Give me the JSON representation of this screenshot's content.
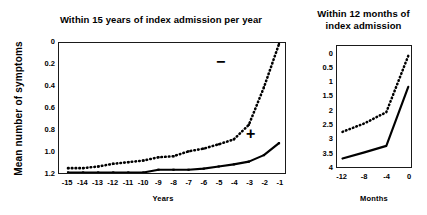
{
  "figure": {
    "ylabel": "Mean number of symptoms"
  },
  "panels": {
    "left": {
      "title": "Within 15 years of index admission per year",
      "xlabel": "Years",
      "yticks": [
        "1.2",
        "1.0",
        "0.8",
        "0.6",
        "0.4",
        "0.2",
        "0"
      ],
      "xticks": [
        "-15",
        "-14",
        "-13",
        "-12",
        "-11",
        "-10",
        "-9",
        "-8",
        "-7",
        "-6",
        "-5",
        "-4",
        "-3",
        "-2",
        "-1"
      ],
      "marker_negative": "−",
      "marker_positive": "+"
    },
    "right": {
      "title_line1": "Within 12 months of",
      "title_line2": "index admission",
      "xlabel": "Months",
      "yticks": [
        "4",
        "3.5",
        "3",
        "2.5",
        "2",
        "1.5",
        "1",
        "0.5",
        "0"
      ],
      "xticks": [
        "-12",
        "-8",
        "-4",
        "0"
      ]
    }
  },
  "chart_data": [
    {
      "type": "line",
      "id": "left-panel",
      "title": "Within 15 years of index admission per year",
      "xlabel": "Years",
      "ylabel": "Mean number of symptoms",
      "x": [
        -15,
        -14,
        -13,
        -12,
        -11,
        -10,
        -9,
        -8,
        -7,
        -6,
        -5,
        -4,
        -3,
        -2,
        -1
      ],
      "xlim": [
        -15.6,
        -0.6
      ],
      "ylim": [
        0,
        1.2
      ],
      "yticks": [
        0,
        0.2,
        0.4,
        0.6,
        0.8,
        1.0,
        1.2
      ],
      "grid": false,
      "legend": "inline annotation symbols on curves",
      "series": [
        {
          "name": "−",
          "label": "minus (negative)",
          "style": "dotted",
          "color": "#000000",
          "values": [
            0.045,
            0.045,
            0.06,
            0.085,
            0.1,
            0.115,
            0.145,
            0.155,
            0.2,
            0.225,
            0.265,
            0.31,
            0.445,
            0.79,
            1.19
          ]
        },
        {
          "name": "+",
          "label": "plus (positive)",
          "style": "solid",
          "color": "#000000",
          "values": [
            0.005,
            0.005,
            0.005,
            0.005,
            0.005,
            0.005,
            0.03,
            0.03,
            0.03,
            0.04,
            0.06,
            0.08,
            0.105,
            0.165,
            0.275
          ]
        }
      ]
    },
    {
      "type": "line",
      "id": "right-panel",
      "title": "Within 12 months of index admission",
      "xlabel": "Months",
      "ylabel": "Mean number of symptoms",
      "x": [
        -12,
        -8,
        -4,
        0
      ],
      "xlim": [
        -13,
        0.5
      ],
      "ylim": [
        0,
        4.3
      ],
      "yticks": [
        0,
        0.5,
        1,
        1.5,
        2,
        2.5,
        3,
        3.5,
        4
      ],
      "grid": false,
      "series": [
        {
          "name": "−",
          "label": "minus (negative)",
          "style": "dotted",
          "color": "#000000",
          "values": [
            1.25,
            1.55,
            1.95,
            3.95
          ]
        },
        {
          "name": "+",
          "label": "plus (positive)",
          "style": "solid",
          "color": "#000000",
          "values": [
            0.3,
            0.52,
            0.75,
            2.85
          ]
        }
      ]
    }
  ]
}
